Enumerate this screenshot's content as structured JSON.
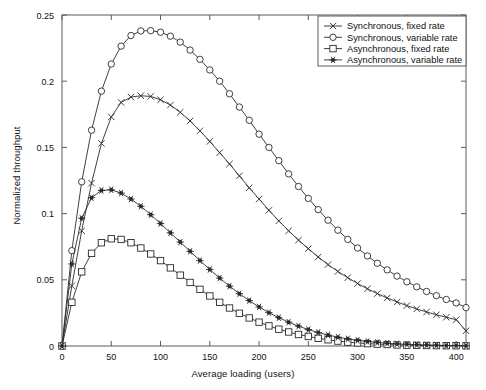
{
  "chart_data": {
    "type": "line",
    "title": "",
    "xlabel": "Average loading (users)",
    "ylabel": "Normalized throughput",
    "xlim": [
      0,
      410
    ],
    "ylim": [
      0,
      0.25
    ],
    "xticks": [
      0,
      50,
      100,
      150,
      200,
      250,
      300,
      350,
      400
    ],
    "yticks": [
      0,
      0.05,
      0.1,
      0.15,
      0.2,
      0.25
    ],
    "ytick_labels": [
      "0",
      "0.05",
      "0.1",
      "0.15",
      "0.2",
      "0.25"
    ],
    "xtick_labels": [
      "0",
      "50",
      "100",
      "150",
      "200",
      "250",
      "300",
      "350",
      "400"
    ],
    "grid": false,
    "legend_position": "top-right",
    "x": [
      0,
      10,
      20,
      30,
      40,
      50,
      60,
      70,
      80,
      90,
      100,
      110,
      120,
      130,
      140,
      150,
      160,
      170,
      180,
      190,
      200,
      210,
      220,
      230,
      240,
      250,
      260,
      270,
      280,
      290,
      300,
      310,
      320,
      330,
      340,
      350,
      360,
      370,
      380,
      390,
      400,
      410
    ],
    "series": [
      {
        "name": "Synchronous, fixed rate",
        "marker": "x",
        "values": [
          0,
          0.0455,
          0.087,
          0.123,
          0.153,
          0.173,
          0.184,
          0.188,
          0.189,
          0.1885,
          0.186,
          0.182,
          0.1765,
          0.17,
          0.1625,
          0.1545,
          0.146,
          0.1375,
          0.1285,
          0.1195,
          0.111,
          0.1025,
          0.0945,
          0.087,
          0.08,
          0.0735,
          0.0672,
          0.0615,
          0.0563,
          0.0516,
          0.0472,
          0.0432,
          0.0396,
          0.0363,
          0.0333,
          0.0305,
          0.028,
          0.0257,
          0.0236,
          0.0217,
          0.0199,
          0.0115
        ]
      },
      {
        "name": "Synchronous, variable rate",
        "marker": "o",
        "values": [
          0,
          0.072,
          0.124,
          0.163,
          0.1925,
          0.213,
          0.2265,
          0.2345,
          0.238,
          0.2382,
          0.237,
          0.234,
          0.2295,
          0.2235,
          0.2165,
          0.2085,
          0.2,
          0.1905,
          0.1805,
          0.1705,
          0.16,
          0.15,
          0.14,
          0.13,
          0.1205,
          0.1115,
          0.103,
          0.095,
          0.0875,
          0.0805,
          0.074,
          0.068,
          0.0625,
          0.0575,
          0.0528,
          0.0485,
          0.0447,
          0.0412,
          0.038,
          0.0351,
          0.0325,
          0.029
        ]
      },
      {
        "name": "Asynchronous, fixed rate",
        "marker": "s",
        "values": [
          0,
          0.033,
          0.056,
          0.07,
          0.078,
          0.081,
          0.0805,
          0.078,
          0.074,
          0.0695,
          0.0645,
          0.059,
          0.0535,
          0.048,
          0.0428,
          0.0378,
          0.033,
          0.0287,
          0.0247,
          0.0212,
          0.018,
          0.0152,
          0.0127,
          0.0106,
          0.0087,
          0.0072,
          0.0058,
          0.0047,
          0.0037,
          0.0029,
          0.0023,
          0.0018,
          0.0014,
          0.0011,
          0.0008,
          0.0006,
          0.0005,
          0.0004,
          0.0003,
          0.0002,
          0.0002,
          0.0001
        ]
      },
      {
        "name": "Asynchronous, variable rate",
        "marker": "star",
        "values": [
          0,
          0.062,
          0.0965,
          0.112,
          0.1175,
          0.118,
          0.1155,
          0.111,
          0.1055,
          0.0992,
          0.0925,
          0.0855,
          0.0785,
          0.0715,
          0.0645,
          0.0578,
          0.0513,
          0.0452,
          0.0395,
          0.0343,
          0.0295,
          0.0252,
          0.0214,
          0.018,
          0.015,
          0.0124,
          0.0102,
          0.0083,
          0.0067,
          0.0054,
          0.0043,
          0.0034,
          0.0027,
          0.0021,
          0.0016,
          0.0013,
          0.001,
          0.0008,
          0.0006,
          0.0004,
          0.0003,
          0.0002
        ]
      }
    ]
  },
  "legend": {
    "items": [
      {
        "label": "Synchronous, fixed rate",
        "marker": "x"
      },
      {
        "label": "Synchronous, variable rate",
        "marker": "o"
      },
      {
        "label": "Asynchronous, fixed rate",
        "marker": "s"
      },
      {
        "label": "Asynchronous, variable rate",
        "marker": "star"
      }
    ]
  },
  "colors": {
    "line": "#2b2b2b",
    "axis": "#5a5a5a",
    "text": "#111111",
    "background": "#ffffff"
  }
}
